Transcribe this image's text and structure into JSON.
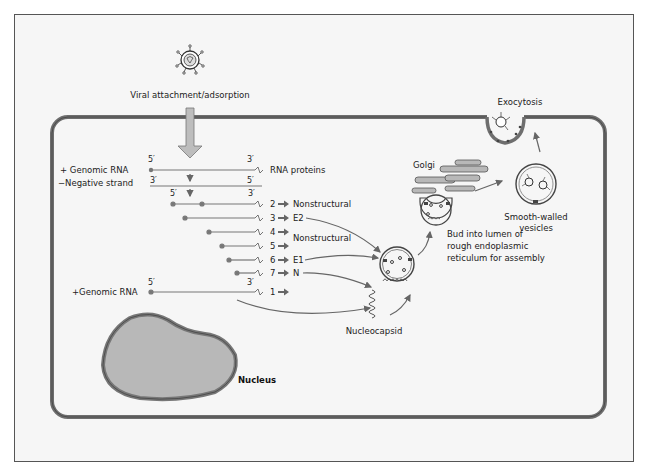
{
  "diagram": {
    "labels": {
      "attachment": "Viral attachment/adsorption",
      "genomic_rna_top": "+ Genomic RNA",
      "negative_strand": "−Negative strand",
      "rna_proteins": "RNA proteins",
      "genomic_rna_bottom": "+Genomic RNA",
      "nucleus": "Nucleus",
      "nucleocapsid": "Nucleocapsid",
      "golgi": "Golgi",
      "exocytosis": "Exocytosis",
      "smooth_walled_1": "Smooth-walled",
      "smooth_walled_2": "vesicles",
      "bud_1": "Bud into lumen of",
      "bud_2": "rough endoplasmic",
      "bud_3": "reticulum for assembly",
      "five_prime": "5′",
      "three_prime": "3′"
    },
    "transcripts": [
      {
        "num": "2",
        "product": "Nonstructural"
      },
      {
        "num": "3",
        "product": "E2"
      },
      {
        "num": "4",
        "product": ""
      },
      {
        "num": "5",
        "product": ""
      },
      {
        "num": "6",
        "product": "E1"
      },
      {
        "num": "7",
        "product": "N"
      },
      {
        "num": "1",
        "product": ""
      }
    ],
    "nonstructural_45": "Nonstructural",
    "colors": {
      "membrane": "#6e6e6e",
      "nucleus_fill": "#b8b8b8",
      "nucleus_border": "#7a7a7a",
      "arrow_fill": "#bdbdbd",
      "line": "#555555",
      "background": "#f6f6f6"
    }
  }
}
